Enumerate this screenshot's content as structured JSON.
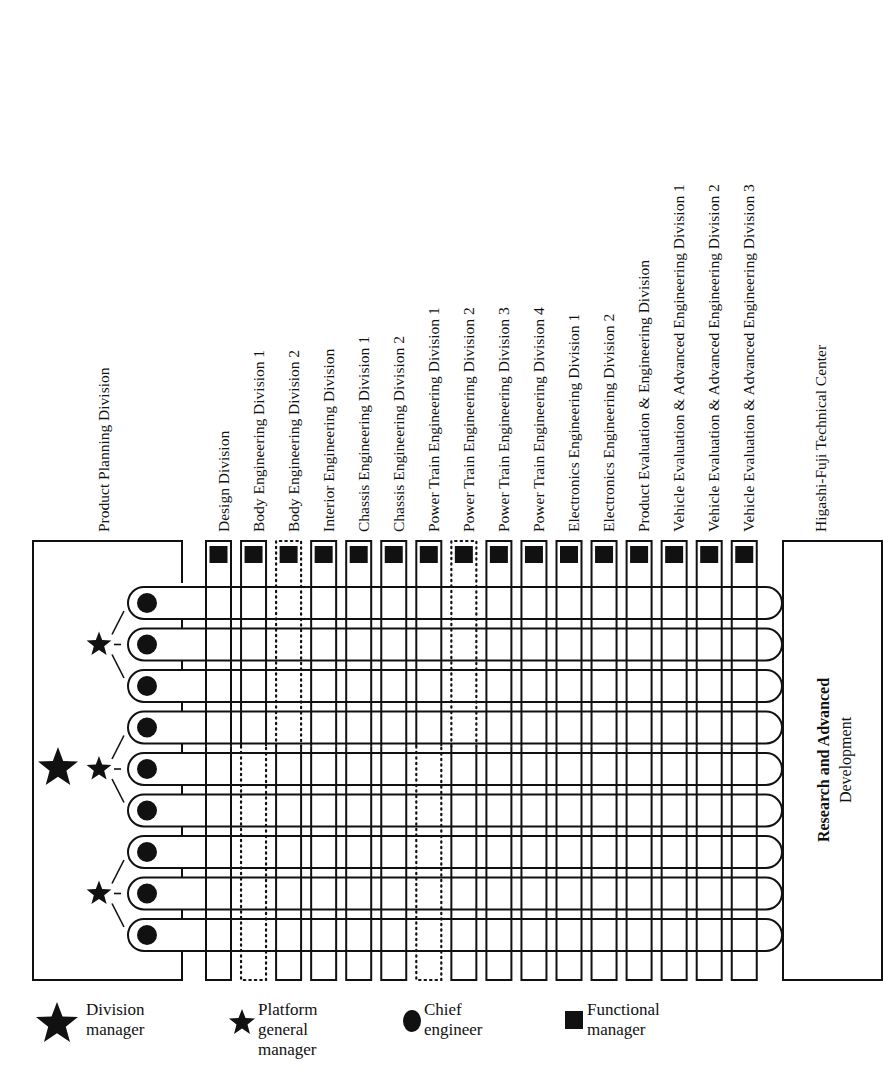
{
  "diagram": {
    "left_division": "Product Planning Division",
    "columns": [
      {
        "label": "Design Division",
        "style": "solid"
      },
      {
        "label": "Body Engineering Division 1",
        "style": "solid-top-dotted-bottom"
      },
      {
        "label": "Body Engineering Division 2",
        "style": "dotted-top-solid-bottom"
      },
      {
        "label": "Interior Engineering Division",
        "style": "solid"
      },
      {
        "label": "Chassis Engineering Division 1",
        "style": "solid"
      },
      {
        "label": "Chassis Engineering Division 2",
        "style": "solid"
      },
      {
        "label": "Power Train Engineering Division 1",
        "style": "solid-top-dotted-bottom"
      },
      {
        "label": "Power Train Engineering Division 2",
        "style": "dotted-top-solid-bottom"
      },
      {
        "label": "Power Train Engineering Division 3",
        "style": "solid"
      },
      {
        "label": "Power Train Engineering Division 4",
        "style": "solid"
      },
      {
        "label": "Electronics Engineering Division 1",
        "style": "solid"
      },
      {
        "label": "Electronics Engineering Division 2",
        "style": "solid"
      },
      {
        "label": "Product Evaluation & Engineering Division",
        "style": "solid"
      },
      {
        "label": "Vehicle Evaluation & Advanced Engineering Division 1",
        "style": "solid"
      },
      {
        "label": "Vehicle Evaluation & Advanced Engineering Division 2",
        "style": "solid"
      },
      {
        "label": "Vehicle Evaluation & Advanced Engineering Division 3",
        "style": "solid"
      }
    ],
    "right_center": "Higashi-Fuji Technical Center",
    "right_box": {
      "line1": "Research and Advanced",
      "line2": "Development"
    },
    "projects_count": 9,
    "platform_groups": 3,
    "division_managers": 1,
    "functional_managers": 16
  },
  "legend": [
    {
      "icon": "large-star",
      "lines": [
        "Division",
        "manager"
      ]
    },
    {
      "icon": "small-star",
      "lines": [
        "Platform",
        "general",
        "manager"
      ]
    },
    {
      "icon": "circle",
      "lines": [
        "Chief",
        "engineer"
      ]
    },
    {
      "icon": "square",
      "lines": [
        "Functional",
        "manager"
      ]
    }
  ]
}
